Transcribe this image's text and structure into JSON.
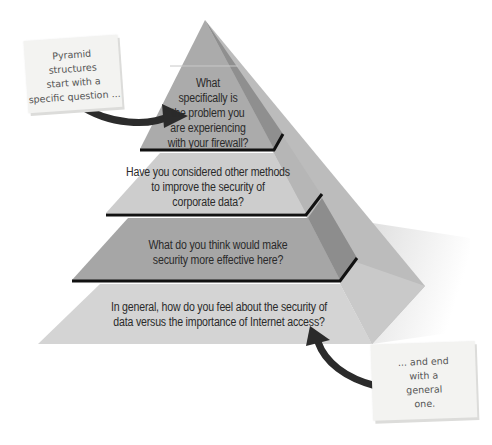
{
  "diagram": {
    "tiers": [
      {
        "level": 1,
        "label": "What specifically is the problem you are experiencing with your firewall?",
        "lines": [
          "What",
          "specifically is",
          "the problem you",
          "are experiencing",
          "with your firewall?"
        ],
        "front_color": "#a9a9a9",
        "side_color": "#8e8e8e"
      },
      {
        "level": 2,
        "label": "Have you considered other methods to improve the security of corporate data?",
        "lines": [
          "Have you considered other methods",
          "to improve the security of",
          "corporate data?"
        ],
        "front_color": "#cfcfcf",
        "side_color": "#b4b4b4"
      },
      {
        "level": 3,
        "label": "What do you think would make security more effective here?",
        "lines": [
          "What do you think would make",
          "security more effective here?"
        ],
        "front_color": "#a4a4a4",
        "side_color": "#8a8a8a"
      },
      {
        "level": 4,
        "label": "In general, how do you feel about the security of data versus the importance of Internet access?",
        "lines": [
          "In general, how do you feel about the security of",
          "data versus the importance of Internet access?"
        ],
        "front_color": "#d6d6d6",
        "side_color": "#c4c4c4"
      }
    ],
    "notes": [
      {
        "id": "top-note",
        "lines": [
          "Pyramid",
          "structures",
          "start with a",
          "specific question ..."
        ],
        "points_to": "tier-1"
      },
      {
        "id": "bottom-note",
        "lines": [
          "... and end",
          "with a",
          "general",
          "one."
        ],
        "points_to": "tier-4"
      }
    ],
    "colors": {
      "divider": "#111111",
      "arrow": "#2b2b2b",
      "note_bg": "#f3f3f1",
      "shadow": "#e6e6e6"
    }
  }
}
